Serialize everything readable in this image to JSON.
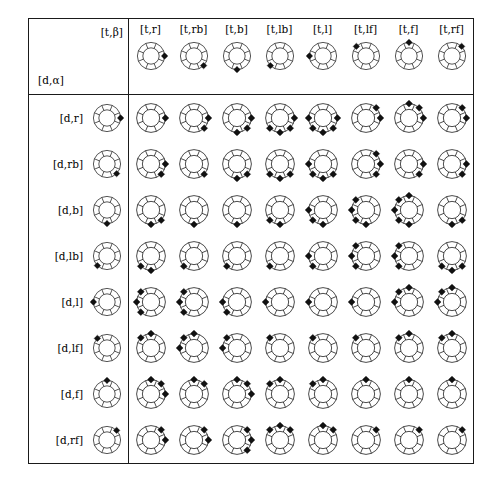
{
  "table": {
    "corner": {
      "col_param_label": "[t,β]",
      "row_param_label": "[d,α]"
    },
    "directions": [
      "r",
      "rb",
      "b",
      "lb",
      "l",
      "lf",
      "f",
      "rf"
    ],
    "columns": [
      {
        "label": "[t,r]",
        "dir": "r",
        "sectors": [
          0
        ]
      },
      {
        "label": "[t,rb]",
        "dir": "rb",
        "sectors": [
          1
        ]
      },
      {
        "label": "[t,b]",
        "dir": "b",
        "sectors": [
          2
        ]
      },
      {
        "label": "[t,lb]",
        "dir": "lb",
        "sectors": [
          3
        ]
      },
      {
        "label": "[t,l]",
        "dir": "l",
        "sectors": [
          4
        ]
      },
      {
        "label": "[t,lf]",
        "dir": "lf",
        "sectors": [
          5
        ]
      },
      {
        "label": "[t,f]",
        "dir": "f",
        "sectors": [
          6
        ]
      },
      {
        "label": "[t,rf]",
        "dir": "rf",
        "sectors": [
          7
        ]
      }
    ],
    "rows": [
      {
        "label": "[d,r]",
        "dir": "r",
        "sectors": [
          0
        ]
      },
      {
        "label": "[d,rb]",
        "dir": "rb",
        "sectors": [
          1
        ]
      },
      {
        "label": "[d,b]",
        "dir": "b",
        "sectors": [
          2
        ]
      },
      {
        "label": "[d,lb]",
        "dir": "lb",
        "sectors": [
          3
        ]
      },
      {
        "label": "[d,l]",
        "dir": "l",
        "sectors": [
          4
        ]
      },
      {
        "label": "[d,lf]",
        "dir": "lf",
        "sectors": [
          5
        ]
      },
      {
        "label": "[d,f]",
        "dir": "f",
        "sectors": [
          6
        ]
      },
      {
        "label": "[d,rf]",
        "dir": "rf",
        "sectors": [
          7
        ]
      }
    ],
    "cells": [
      [
        [
          0
        ],
        [
          0,
          1
        ],
        [
          0,
          1,
          2
        ],
        [
          0,
          1,
          2,
          3
        ],
        [
          0,
          1,
          2,
          3,
          4
        ],
        [
          0,
          7
        ],
        [
          0,
          7,
          6
        ],
        [
          0,
          7
        ]
      ],
      [
        [
          0,
          1
        ],
        [
          1
        ],
        [
          1,
          2
        ],
        [
          1,
          2,
          3
        ],
        [
          1,
          2,
          3,
          4
        ],
        [
          1,
          0,
          7
        ],
        [
          1,
          0
        ],
        [
          1,
          0
        ]
      ],
      [
        [
          1,
          2
        ],
        [
          2
        ],
        [
          2
        ],
        [
          2,
          3
        ],
        [
          2,
          3,
          4
        ],
        [
          2,
          3,
          4,
          5
        ],
        [
          2,
          3,
          4,
          5,
          6
        ],
        [
          2,
          1
        ]
      ],
      [
        [
          2,
          3
        ],
        [
          3
        ],
        [
          3
        ],
        [
          3
        ],
        [
          3,
          4
        ],
        [
          3,
          4,
          5
        ],
        [
          3,
          4,
          5
        ],
        [
          3,
          2,
          1
        ]
      ],
      [
        [
          3,
          4,
          5
        ],
        [
          3,
          4,
          5
        ],
        [
          3,
          4
        ],
        [
          4
        ],
        [
          4
        ],
        [
          4
        ],
        [
          4,
          5,
          6
        ],
        [
          4,
          5,
          6
        ]
      ],
      [
        [
          5,
          6
        ],
        [
          4,
          5,
          6
        ],
        [
          4,
          5
        ],
        [
          5
        ],
        [
          5
        ],
        [
          5
        ],
        [
          5,
          6
        ],
        [
          5,
          6
        ]
      ],
      [
        [
          6,
          7,
          0
        ],
        [
          6,
          7
        ],
        [
          6,
          7,
          0
        ],
        [
          6,
          5
        ],
        [
          6,
          5
        ],
        [
          6
        ],
        [
          6
        ],
        [
          6
        ]
      ],
      [
        [
          7,
          0
        ],
        [
          7,
          0
        ],
        [
          7,
          0,
          1
        ],
        [
          7,
          6,
          5
        ],
        [
          7,
          6
        ],
        [
          7
        ],
        [
          7
        ],
        [
          7
        ]
      ]
    ],
    "colors": {
      "line": "#111111",
      "blob": "#111111",
      "border": "#1a1a1a",
      "background": "#ffffff"
    },
    "ring": {
      "sector_count": 8,
      "header_icon_size": 34,
      "cell_icon_size": 36
    }
  }
}
